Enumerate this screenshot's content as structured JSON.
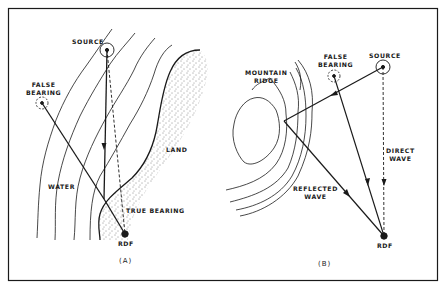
{
  "figure": {
    "panel_a": {
      "caption": "(A)",
      "labels": {
        "source": "SOURCE",
        "false_bearing_1": "FALSE",
        "false_bearing_2": "BEARING",
        "land": "LAND",
        "water": "WATER",
        "true_bearing": "TRUE BEARING",
        "rdf": "RDF"
      }
    },
    "panel_b": {
      "caption": "(B)",
      "labels": {
        "mountain_ridge_1": "MOUNTAIN",
        "mountain_ridge_2": "RIDGE",
        "false_bearing_1": "FALSE",
        "false_bearing_2": "BEARING",
        "source": "SOURCE",
        "direct_wave_1": "DIRECT",
        "direct_wave_2": "WAVE",
        "reflected_wave_1": "REFLECTED",
        "reflected_wave_2": "WAVE",
        "rdf": "RDF"
      }
    },
    "colors": {
      "line": "#1a1a1a",
      "background": "#ffffff"
    }
  }
}
